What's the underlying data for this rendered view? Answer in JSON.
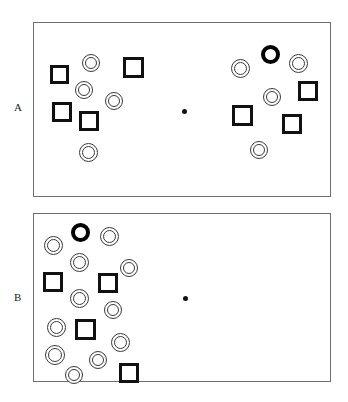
{
  "figure": {
    "background_color": "#ffffff",
    "ink_color": "#111111",
    "frame_color": "#6f6f6f",
    "width": 348,
    "height": 402
  },
  "panels": [
    {
      "id": "panel-a",
      "label": "A",
      "label_x": 14,
      "label_y": 102,
      "frame": {
        "x": 33,
        "y": 22,
        "width": 298,
        "height": 175
      },
      "fixation": {
        "x": 181,
        "y": 108,
        "size": 5
      },
      "items": [
        {
          "kind": "square",
          "x": 49,
          "y": 64,
          "size": 19
        },
        {
          "kind": "circle",
          "x": 81,
          "y": 53,
          "size": 18
        },
        {
          "kind": "square",
          "x": 122,
          "y": 56,
          "size": 21
        },
        {
          "kind": "circle",
          "x": 74,
          "y": 80,
          "size": 18
        },
        {
          "kind": "circle",
          "x": 104,
          "y": 91,
          "size": 18
        },
        {
          "kind": "square",
          "x": 51,
          "y": 101,
          "size": 20
        },
        {
          "kind": "square",
          "x": 78,
          "y": 110,
          "size": 20
        },
        {
          "kind": "circle",
          "x": 78,
          "y": 142,
          "size": 19
        },
        {
          "kind": "target",
          "x": 260,
          "y": 44,
          "size": 19
        },
        {
          "kind": "circle",
          "x": 230,
          "y": 58,
          "size": 19
        },
        {
          "kind": "circle",
          "x": 288,
          "y": 53,
          "size": 19
        },
        {
          "kind": "circle",
          "x": 262,
          "y": 87,
          "size": 18
        },
        {
          "kind": "square",
          "x": 297,
          "y": 80,
          "size": 20
        },
        {
          "kind": "square",
          "x": 231,
          "y": 104,
          "size": 21
        },
        {
          "kind": "square",
          "x": 281,
          "y": 113,
          "size": 20
        },
        {
          "kind": "circle",
          "x": 249,
          "y": 140,
          "size": 18
        }
      ]
    },
    {
      "id": "panel-b",
      "label": "B",
      "label_x": 14,
      "label_y": 292,
      "frame": {
        "x": 33,
        "y": 213,
        "width": 298,
        "height": 169
      },
      "fixation": {
        "x": 182,
        "y": 295,
        "size": 5
      },
      "items": [
        {
          "kind": "target",
          "x": 70,
          "y": 222,
          "size": 19
        },
        {
          "kind": "circle",
          "x": 43,
          "y": 235,
          "size": 19
        },
        {
          "kind": "circle",
          "x": 99,
          "y": 226,
          "size": 19
        },
        {
          "kind": "circle",
          "x": 69,
          "y": 252,
          "size": 19
        },
        {
          "kind": "circle",
          "x": 119,
          "y": 258,
          "size": 18
        },
        {
          "kind": "square",
          "x": 42,
          "y": 271,
          "size": 20
        },
        {
          "kind": "square",
          "x": 97,
          "y": 272,
          "size": 20
        },
        {
          "kind": "circle",
          "x": 69,
          "y": 288,
          "size": 19
        },
        {
          "kind": "circle",
          "x": 103,
          "y": 300,
          "size": 18
        },
        {
          "kind": "circle",
          "x": 46,
          "y": 317,
          "size": 19
        },
        {
          "kind": "square",
          "x": 74,
          "y": 318,
          "size": 21
        },
        {
          "kind": "circle",
          "x": 110,
          "y": 332,
          "size": 19
        },
        {
          "kind": "circle",
          "x": 44,
          "y": 344,
          "size": 20
        },
        {
          "kind": "circle",
          "x": 88,
          "y": 350,
          "size": 18
        },
        {
          "kind": "circle",
          "x": 64,
          "y": 365,
          "size": 18
        },
        {
          "kind": "square",
          "x": 118,
          "y": 362,
          "size": 20
        }
      ]
    }
  ]
}
